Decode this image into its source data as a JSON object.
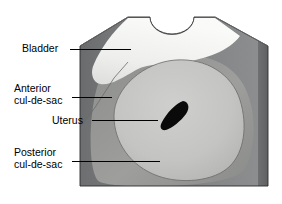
{
  "figure": {
    "type": "anatomical-illustration",
    "background_color": "#ffffff",
    "labels": [
      {
        "id": "bladder",
        "text": "Bladder",
        "lines": [
          "Bladder"
        ],
        "leader_from_x": 70,
        "leader_to_x": 131,
        "leader_y": 49
      },
      {
        "id": "anterior-cul-de-sac",
        "text": "Anterior cul-de-sac",
        "lines": [
          "Anterior",
          "cul-de-sac"
        ],
        "leader_from_x": 72,
        "leader_to_x": 112,
        "leader_y": 97
      },
      {
        "id": "uterus",
        "text": "Uterus",
        "lines": [
          "Uterus"
        ],
        "leader_from_x": 92,
        "leader_to_x": 158,
        "leader_y": 120
      },
      {
        "id": "posterior-cul-de-sac",
        "text": "Posterior cul-de-sac",
        "lines": [
          "Posterior",
          "cul-de-sac"
        ],
        "leader_from_x": 72,
        "leader_to_x": 160,
        "leader_y": 161
      }
    ],
    "structures": [
      {
        "id": "outer-tissue-block",
        "name": "Outer tissue block",
        "color": "#787a7c"
      },
      {
        "id": "left-wall-shadow",
        "name": "Left wall shadow",
        "color": "#6e7072"
      },
      {
        "id": "bladder-region",
        "name": "Bladder region",
        "color": "#f2f2f0"
      },
      {
        "id": "uterus-body",
        "name": "Uterus body",
        "color": "#c4c4c2"
      },
      {
        "id": "surrounding-tissue",
        "name": "Surrounding tissue",
        "color": "#9b9b99"
      },
      {
        "id": "endometrial-cavity",
        "name": "Endometrial cavity",
        "color": "#0a0a0a"
      },
      {
        "id": "top-notch",
        "name": "Top notch",
        "color": "#ffffff"
      },
      {
        "id": "right-bevel",
        "name": "Right bevel edge",
        "color": "#6a6c6e"
      }
    ],
    "colors": {
      "outline": "#2b2b2b",
      "leader": "#000000",
      "label_text": "#000000"
    }
  }
}
